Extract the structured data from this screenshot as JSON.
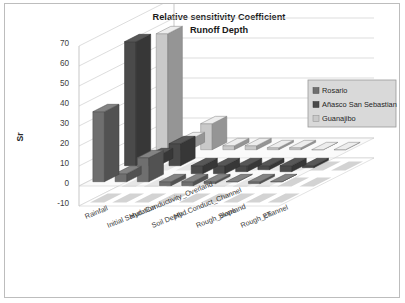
{
  "chart_data": {
    "type": "bar",
    "title": "Relative sensitivity Coefficient",
    "subtitle": "Runoff Depth",
    "xlabel": "",
    "ylabel": "Sr",
    "ylim": [
      -10,
      70
    ],
    "ytick_step": 10,
    "yticks": [
      "70",
      "60",
      "50",
      "40",
      "30",
      "20",
      "10",
      "0",
      "-10"
    ],
    "grid": true,
    "legend_position": "right",
    "three_d": true,
    "categories": [
      "Rainfall",
      "Initial Saturation",
      "Hyd. Conductivity_Overland",
      "Soil Depth",
      "Hyd.Conduct_Channel",
      "Rough_overland",
      "Slope",
      "Rough_channel",
      "ET"
    ],
    "series": [
      {
        "name": "Rosario",
        "color": "#6f6f6f",
        "values": [
          35,
          4,
          12,
          -2,
          -2,
          -1,
          0,
          -1,
          0
        ]
      },
      {
        "name": "Añasco San Sebastian",
        "color": "#4a4a4a",
        "values": [
          62,
          5,
          11,
          -4,
          -4,
          -3,
          -2,
          -3,
          -1
        ]
      },
      {
        "name": "Guanajibo",
        "color": "#c9c9c9",
        "values": [
          58,
          5,
          13,
          2,
          2,
          1,
          1,
          0,
          0
        ]
      }
    ]
  },
  "legend": {
    "items": [
      {
        "label": "Rosario"
      },
      {
        "label": "Añasco San Sebastian"
      },
      {
        "label": "Guanajibo"
      }
    ]
  },
  "axis": {
    "y_title": "Sr"
  }
}
